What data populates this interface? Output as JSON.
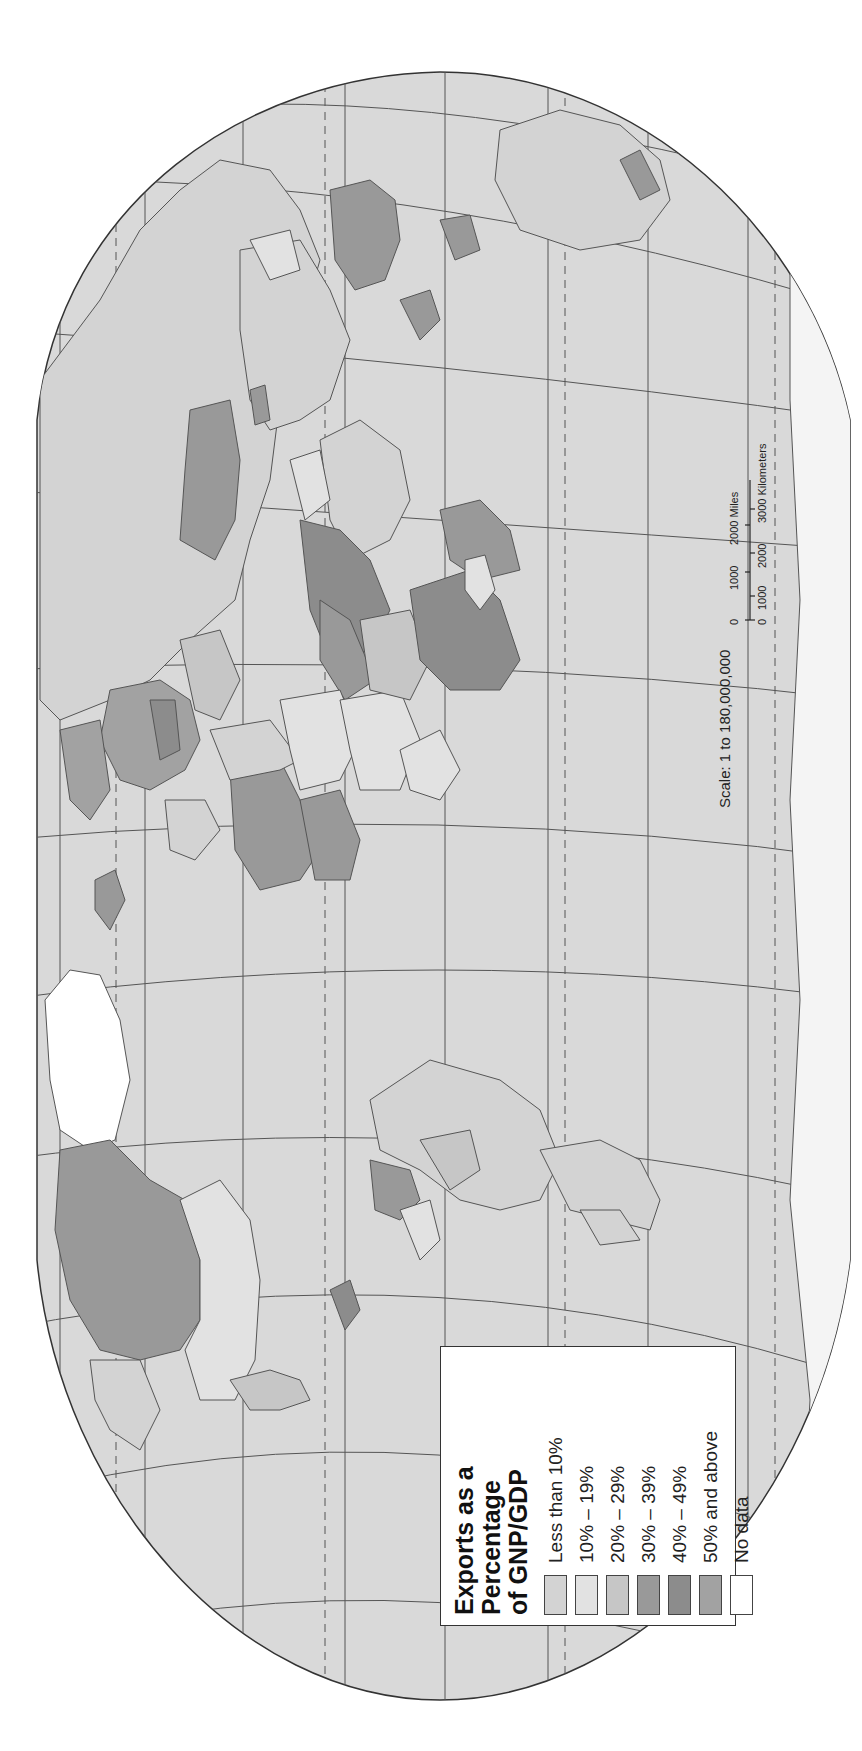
{
  "map": {
    "title": "Exports as a Percentage of GNP/GDP",
    "orientation": "rotated 90° counter-clockwise (north to the left)",
    "colors": {
      "ocean": "#d9d9d9",
      "outline": "#444444",
      "graticule": "#555555"
    }
  },
  "legend": {
    "title_line1": "Exports as a Percentage",
    "title_line2": "of GNP/GDP",
    "items": [
      {
        "label": "Less than 10%",
        "color": "#d3d3d3"
      },
      {
        "label": "10% – 19%",
        "color": "#e2e2e2"
      },
      {
        "label": "20% – 29%",
        "color": "#c6c6c6"
      },
      {
        "label": "30% – 39%",
        "color": "#999999"
      },
      {
        "label": "40% – 49%",
        "color": "#8c8c8c"
      },
      {
        "label": "50% and above",
        "color": "#a2a2a2"
      },
      {
        "label": "No data",
        "color": "#ffffff"
      }
    ]
  },
  "scale": {
    "text": "Scale:  1 to 180,000,000",
    "miles_ticks": [
      "0",
      "1000",
      "2000 Miles"
    ],
    "km_ticks": [
      "0",
      "1000",
      "2000",
      "3000 Kilometers"
    ]
  }
}
